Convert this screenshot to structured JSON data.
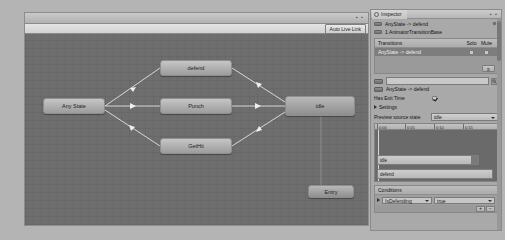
{
  "animator": {
    "auto_live_link": "Auto Live Link",
    "window_dots": "▪ ▪",
    "nodes": [
      {
        "id": "any-state",
        "label": "Any State",
        "x": 18,
        "y": 64,
        "w": 62,
        "h": 16,
        "style": "grey"
      },
      {
        "id": "defend",
        "label": "defend",
        "x": 135,
        "y": 26,
        "w": 72,
        "h": 16,
        "style": "grey"
      },
      {
        "id": "punch",
        "label": "Punch",
        "x": 135,
        "y": 64,
        "w": 72,
        "h": 16,
        "style": "grey"
      },
      {
        "id": "gethit",
        "label": "GetHit",
        "x": 135,
        "y": 104,
        "w": 72,
        "h": 16,
        "style": "grey"
      },
      {
        "id": "idle",
        "label": "idle",
        "x": 260,
        "y": 62,
        "w": 70,
        "h": 20,
        "style": "dark"
      },
      {
        "id": "entry",
        "label": "Entry",
        "x": 283,
        "y": 151,
        "w": 46,
        "h": 13,
        "style": "dark"
      }
    ],
    "transitions": [
      {
        "from": "any-state",
        "to": "defend"
      },
      {
        "from": "any-state",
        "to": "punch"
      },
      {
        "from": "any-state",
        "to": "gethit"
      },
      {
        "from": "defend",
        "to": "idle"
      },
      {
        "from": "punch",
        "to": "idle"
      },
      {
        "from": "gethit",
        "to": "idle"
      }
    ]
  },
  "inspector": {
    "tab_label": "Inspector",
    "lock_dots": "▪ ▪",
    "title": "AnyState -> defend",
    "subtitle": "1 AnimatorTransitionBase",
    "transitions_section": {
      "header": "Transitions",
      "solo_label": "Solo",
      "mute_label": "Mute",
      "rows": [
        {
          "label": "AnyState -> defend",
          "solo": false,
          "mute": false
        }
      ],
      "menu_button": "≡"
    },
    "transition_name": {
      "value": "",
      "placeholder": ""
    },
    "transition_sub_label": "AnyState -> defend",
    "has_exit_time": {
      "label": "Has Exit Time",
      "checked": true
    },
    "settings_label": "Settings",
    "preview": {
      "label": "Preview source state",
      "value": "idle",
      "ticks": [
        {
          "label": "0:00",
          "pos": 2
        },
        {
          "label": "0:05",
          "pos": 30
        },
        {
          "label": "0:10",
          "pos": 59
        },
        {
          "label": "0:15",
          "pos": 88
        }
      ],
      "clips": [
        {
          "label": "idle",
          "top": 25,
          "left": 2,
          "width": 102
        },
        {
          "label": "defend",
          "top": 39,
          "left": 2,
          "width": 116
        }
      ]
    },
    "conditions_section": {
      "header": "Conditions",
      "rows": [
        {
          "parameter": "IsDefending",
          "value": "true"
        }
      ],
      "add_button": "+",
      "remove_button": "−"
    }
  },
  "colors": {
    "graph_bg": "#6e6e6e",
    "chrome": "#a8a8a8",
    "node_fill": "#bdbdbd",
    "selected_row": "#7d7d7d",
    "page_bg": "#b4b4b4"
  }
}
